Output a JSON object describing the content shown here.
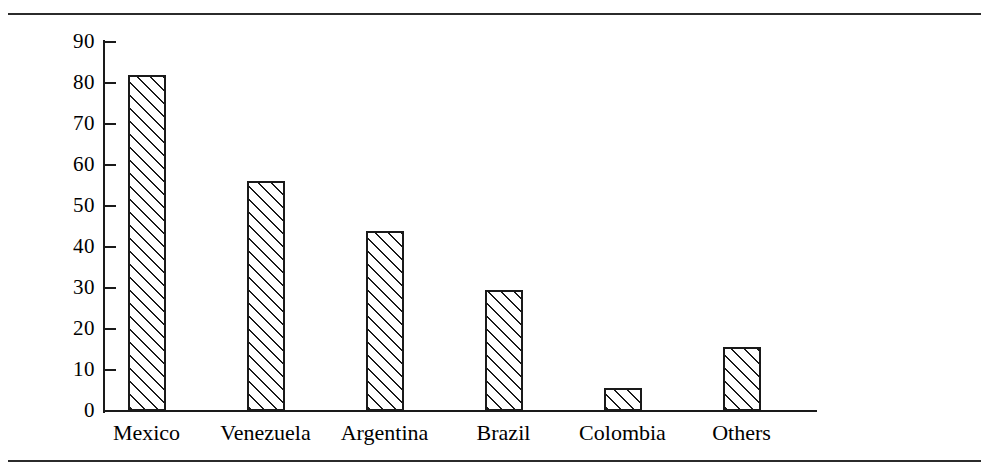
{
  "figure": {
    "background_color": "#ffffff",
    "ink_color": "#1a1a1a",
    "rule_color": "#2b2b2b"
  },
  "chart_data": {
    "type": "bar",
    "title": "",
    "subtitle": "",
    "xlabel": "",
    "ylabel": "Dollars (billions)",
    "categories": [
      "Mexico",
      "Venezuela",
      "Argentina",
      "Brazil",
      "Colombia",
      "Others"
    ],
    "values": [
      82,
      56,
      44,
      29.5,
      5.5,
      15.5
    ],
    "ylim": [
      0,
      90
    ],
    "ytick_values": [
      0,
      10,
      20,
      30,
      40,
      50,
      60,
      70,
      80,
      90
    ],
    "ytick_labels": [
      "0",
      "10",
      "20",
      "30",
      "40",
      "50",
      "60",
      "70",
      "80",
      "90"
    ],
    "grid": false,
    "legend": null,
    "legend_position": "none",
    "bar_fill": "diagonal-hatch-45",
    "annotations": []
  }
}
